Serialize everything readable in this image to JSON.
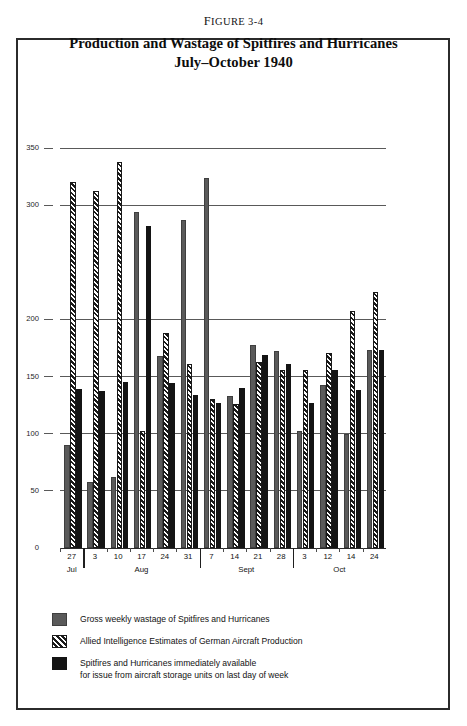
{
  "figure": {
    "label_prefix": "F",
    "label": "IGURE 3-4",
    "label_full": "Figure 3-4",
    "title_line1": "Production and Wastage of Spitfires and Hurricanes",
    "title_line2": "July–October 1940"
  },
  "legend": {
    "items": [
      {
        "swatch": "wastage",
        "text": "Gross weekly wastage of Spitfires and Hurricanes"
      },
      {
        "swatch": "production",
        "text": "Allied Intelligence Estimates of German Aircraft Production"
      },
      {
        "swatch": "available",
        "text": "Spitfires and Hurricanes immediately available",
        "text2": "for issue from aircraft storage units on last day of week"
      }
    ]
  },
  "colors": {
    "wastage": "#5a5a5a",
    "production": "#1a1a1a",
    "available": "#141414",
    "grid": "#595959",
    "axis": "#2b2b2b",
    "frame": "#2b2b2b",
    "background": "#ffffff"
  },
  "chart_data": {
    "type": "bar",
    "title": "Production and Wastage of Spitfires and Hurricanes July–October 1940",
    "xlabel": "",
    "ylabel": "",
    "ylim": [
      0,
      350
    ],
    "yticks": [
      0,
      50,
      100,
      150,
      200,
      300,
      350
    ],
    "ytick_labels": [
      "0",
      "50",
      "100",
      "150",
      "200",
      "300",
      "350"
    ],
    "grid": true,
    "legend_position": "below",
    "categories": [
      "27",
      "3",
      "10",
      "17",
      "24",
      "31",
      "7",
      "14",
      "21",
      "28",
      "3",
      "12",
      "14",
      "24"
    ],
    "months": [
      {
        "name": "Jul",
        "start": 0,
        "count": 1
      },
      {
        "name": "Aug",
        "start": 1,
        "count": 5
      },
      {
        "name": "Sept",
        "start": 6,
        "count": 4
      },
      {
        "name": "Oct",
        "start": 10,
        "count": 4
      }
    ],
    "series": [
      {
        "name": "Gross weekly wastage of Spitfires and Hurricanes",
        "key": "wastage",
        "color": "#5a5a5a",
        "values": [
          90,
          58,
          62,
          294,
          168,
          287,
          324,
          133,
          178,
          172,
          102,
          143,
          100,
          173
        ]
      },
      {
        "name": "Allied Intelligence Estimates of German Aircraft Production",
        "key": "production",
        "color": "#1a1a1a",
        "values": [
          320,
          312,
          338,
          102,
          188,
          161,
          130,
          126,
          163,
          156,
          156,
          171,
          207,
          224
        ]
      },
      {
        "name": "Spitfires and Hurricanes immediately available for issue from aircraft storage units on last day of week",
        "key": "available",
        "color": "#141414",
        "values": [
          139,
          137,
          145,
          282,
          144,
          134,
          127,
          140,
          169,
          161,
          127,
          156,
          138,
          173
        ]
      }
    ]
  }
}
